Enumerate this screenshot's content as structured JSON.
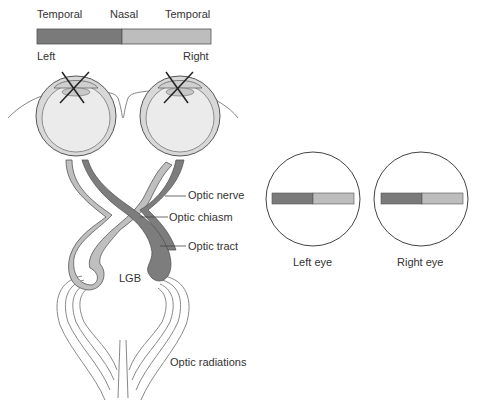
{
  "visual_field": {
    "labels": {
      "left_temporal": "Temporal",
      "nasal": "Nasal",
      "right_temporal": "Temporal"
    },
    "sides": {
      "left": "Left",
      "right": "Right"
    },
    "colors": {
      "left_half": "#7a7a7a",
      "right_half": "#bdbdbd"
    }
  },
  "pathway_labels": {
    "optic_nerve": "Optic nerve",
    "optic_chiasm": "Optic chiasm",
    "optic_tract": "Optic tract",
    "lgb": "LGB",
    "optic_radiations": "Optic radiations"
  },
  "perceived_fields": {
    "left_eye": "Left eye",
    "right_eye": "Right eye"
  },
  "colors": {
    "dark_pathway": "#7d7d7d",
    "light_pathway": "#bfbfbf",
    "outline": "#555555",
    "eye_fill": "#e6e6e6"
  }
}
